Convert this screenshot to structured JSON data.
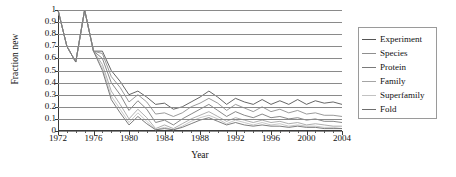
{
  "chart_data": {
    "type": "line",
    "title": "",
    "xlabel": "Year",
    "ylabel": "Fraction new",
    "xlim": [
      1972,
      2004
    ],
    "ylim": [
      0,
      1
    ],
    "grid": true,
    "legend_position": "right",
    "x": [
      1972,
      1973,
      1974,
      1975,
      1976,
      1977,
      1978,
      1979,
      1980,
      1981,
      1982,
      1983,
      1984,
      1985,
      1986,
      1987,
      1988,
      1989,
      1990,
      1991,
      1992,
      1993,
      1994,
      1995,
      1996,
      1997,
      1998,
      1999,
      2000,
      2001,
      2002,
      2003,
      2004
    ],
    "xticklabels": [
      "1972",
      "1976",
      "1980",
      "1984",
      "1988",
      "1992",
      "1996",
      "2000",
      "2004"
    ],
    "xtickvalues": [
      1972,
      1976,
      1980,
      1984,
      1988,
      1992,
      1996,
      2000,
      2004
    ],
    "yticklabels": [
      "0",
      "0.1",
      "0.2",
      "0.3",
      "0.4",
      "0.5",
      "0.6",
      "0.7",
      "0.8",
      "0.9",
      "1"
    ],
    "ytickvalues": [
      0,
      0.1,
      0.2,
      0.3,
      0.4,
      0.5,
      0.6,
      0.7,
      0.8,
      0.9,
      1
    ],
    "series": [
      {
        "name": "Experiment",
        "color": "#555555",
        "values": [
          1.0,
          0.7,
          0.57,
          1.0,
          0.66,
          0.66,
          0.5,
          0.41,
          0.3,
          0.33,
          0.28,
          0.22,
          0.23,
          0.18,
          0.2,
          0.24,
          0.28,
          0.33,
          0.28,
          0.22,
          0.27,
          0.24,
          0.22,
          0.26,
          0.22,
          0.25,
          0.22,
          0.26,
          0.22,
          0.25,
          0.23,
          0.24,
          0.22
        ]
      },
      {
        "name": "Species",
        "color": "#8f8f8f",
        "values": [
          1.0,
          0.7,
          0.57,
          1.0,
          0.66,
          0.64,
          0.45,
          0.36,
          0.24,
          0.3,
          0.24,
          0.14,
          0.15,
          0.12,
          0.15,
          0.2,
          0.23,
          0.27,
          0.23,
          0.17,
          0.22,
          0.19,
          0.16,
          0.2,
          0.16,
          0.18,
          0.15,
          0.17,
          0.14,
          0.15,
          0.13,
          0.13,
          0.12
        ]
      },
      {
        "name": "Protein",
        "color": "#7a7a7a",
        "values": [
          1.0,
          0.7,
          0.57,
          1.0,
          0.66,
          0.6,
          0.4,
          0.3,
          0.17,
          0.25,
          0.18,
          0.07,
          0.09,
          0.05,
          0.1,
          0.14,
          0.18,
          0.22,
          0.17,
          0.12,
          0.16,
          0.13,
          0.11,
          0.14,
          0.11,
          0.12,
          0.1,
          0.11,
          0.09,
          0.1,
          0.08,
          0.08,
          0.07
        ]
      },
      {
        "name": "Family",
        "color": "#a5a5a5",
        "values": [
          1.0,
          0.7,
          0.57,
          1.0,
          0.66,
          0.55,
          0.33,
          0.22,
          0.1,
          0.18,
          0.11,
          0.02,
          0.05,
          0.02,
          0.06,
          0.1,
          0.13,
          0.16,
          0.12,
          0.08,
          0.11,
          0.09,
          0.07,
          0.09,
          0.07,
          0.08,
          0.06,
          0.07,
          0.05,
          0.06,
          0.05,
          0.04,
          0.04
        ]
      },
      {
        "name": "Superfamily",
        "color": "#c2c2c2",
        "values": [
          1.0,
          0.7,
          0.57,
          1.0,
          0.66,
          0.52,
          0.29,
          0.18,
          0.07,
          0.15,
          0.08,
          0.01,
          0.03,
          0.01,
          0.04,
          0.08,
          0.11,
          0.13,
          0.1,
          0.06,
          0.09,
          0.07,
          0.05,
          0.07,
          0.05,
          0.06,
          0.04,
          0.05,
          0.04,
          0.04,
          0.03,
          0.03,
          0.02
        ]
      },
      {
        "name": "Fold",
        "color": "#6e6e6e",
        "values": [
          1.0,
          0.7,
          0.57,
          1.0,
          0.66,
          0.5,
          0.26,
          0.15,
          0.05,
          0.12,
          0.06,
          0.01,
          0.02,
          0.01,
          0.03,
          0.06,
          0.09,
          0.11,
          0.08,
          0.05,
          0.07,
          0.05,
          0.04,
          0.05,
          0.04,
          0.04,
          0.03,
          0.04,
          0.03,
          0.03,
          0.02,
          0.02,
          0.02
        ]
      }
    ]
  }
}
